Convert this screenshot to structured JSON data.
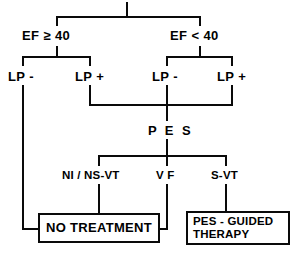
{
  "diagram": {
    "line_color": "#0a0a0a",
    "background": "#ffffff"
  },
  "nodes": {
    "ef_high": "EF ≥ 40",
    "ef_low": "EF < 40",
    "lp_neg_left": "LP -",
    "lp_pos_left": "LP +",
    "lp_neg_right": "LP -",
    "lp_pos_right": "LP +",
    "pes": "P E S",
    "outcome_ni_nsvt": "NI / NS-VT",
    "outcome_vf": "V F",
    "outcome_svt": "S-VT"
  },
  "terminals": {
    "no_treatment": {
      "line1": "NO  TREATMENT"
    },
    "pes_guided": {
      "line1": "PES - GUIDED",
      "line2": "THERAPY"
    }
  }
}
